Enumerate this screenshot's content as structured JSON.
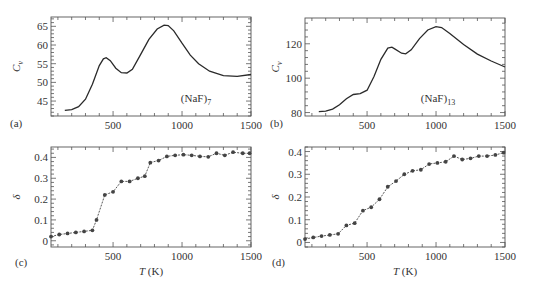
{
  "chart_data": [
    {
      "panel": "(a)",
      "type": "line",
      "ylabel": "C_v",
      "annotation": "(NaF)7",
      "xlim": [
        50,
        1500
      ],
      "ylim": [
        41,
        67.5
      ],
      "xticks": [
        500,
        1000,
        1500
      ],
      "yticks": [
        45,
        50,
        55,
        60,
        65
      ],
      "x": [
        150,
        200,
        250,
        300,
        350,
        400,
        430,
        450,
        480,
        520,
        560,
        600,
        640,
        700,
        760,
        820,
        870,
        900,
        940,
        1000,
        1060,
        1120,
        1200,
        1300,
        1400,
        1500
      ],
      "values": [
        42.5,
        42.7,
        43.5,
        45.5,
        49.5,
        54.5,
        56.3,
        56.6,
        55.8,
        53.8,
        52.6,
        52.5,
        53.5,
        57.5,
        61.5,
        64.3,
        65.3,
        65.2,
        63.8,
        60.5,
        57.3,
        55,
        53,
        51.8,
        51.6,
        52.1
      ]
    },
    {
      "panel": "(b)",
      "type": "line",
      "ylabel": "C_v",
      "annotation": "(NaF)13",
      "xlim": [
        50,
        1500
      ],
      "ylim": [
        78,
        135
      ],
      "xticks": [
        500,
        1000,
        1500
      ],
      "yticks": [
        80,
        100,
        120
      ],
      "x": [
        150,
        200,
        250,
        300,
        350,
        400,
        450,
        500,
        550,
        600,
        650,
        680,
        700,
        750,
        780,
        820,
        880,
        940,
        1000,
        1040,
        1100,
        1200,
        1300,
        1400,
        1500
      ],
      "values": [
        80.5,
        80.8,
        82,
        84.5,
        88,
        90.5,
        91,
        93,
        101,
        111,
        117.5,
        118,
        117,
        114.5,
        114.2,
        116.5,
        123,
        128,
        130,
        129.5,
        126,
        119.5,
        114,
        110,
        106.5
      ]
    },
    {
      "panel": "(c)",
      "type": "line",
      "ylabel": "δ",
      "xlabel": "T (K)",
      "xlim": [
        50,
        1500
      ],
      "ylim": [
        -0.03,
        0.45
      ],
      "xticks": [
        500,
        1000,
        1500
      ],
      "yticks": [
        0,
        0.1,
        0.2,
        0.3,
        0.4
      ],
      "x": [
        50,
        110,
        170,
        230,
        290,
        350,
        380,
        440,
        500,
        560,
        620,
        680,
        730,
        770,
        830,
        890,
        950,
        1010,
        1070,
        1130,
        1190,
        1250,
        1310,
        1370,
        1440,
        1490
      ],
      "values": [
        0.02,
        0.03,
        0.035,
        0.04,
        0.045,
        0.05,
        0.1,
        0.22,
        0.235,
        0.285,
        0.285,
        0.3,
        0.31,
        0.375,
        0.385,
        0.405,
        0.41,
        0.413,
        0.41,
        0.405,
        0.403,
        0.42,
        0.41,
        0.425,
        0.42,
        0.42
      ]
    },
    {
      "panel": "(d)",
      "type": "line",
      "ylabel": "δ",
      "xlabel": "T (K)",
      "xlim": [
        50,
        1500
      ],
      "ylim": [
        -0.02,
        0.42
      ],
      "xticks": [
        500,
        1000,
        1500
      ],
      "yticks": [
        0,
        0.1,
        0.2,
        0.3,
        0.4
      ],
      "x": [
        50,
        110,
        170,
        230,
        290,
        350,
        410,
        470,
        530,
        590,
        650,
        710,
        770,
        830,
        890,
        950,
        1010,
        1070,
        1130,
        1190,
        1250,
        1310,
        1370,
        1430,
        1490
      ],
      "values": [
        0.015,
        0.022,
        0.028,
        0.033,
        0.038,
        0.075,
        0.085,
        0.14,
        0.155,
        0.19,
        0.245,
        0.27,
        0.3,
        0.315,
        0.32,
        0.345,
        0.35,
        0.355,
        0.38,
        0.365,
        0.37,
        0.38,
        0.38,
        0.385,
        0.395
      ]
    }
  ],
  "labels": {
    "a": "(a)",
    "b": "(b)",
    "c": "(c)",
    "d": "(d)",
    "cv": "C",
    "cv_sub": "v",
    "delta": "δ",
    "xlabel_T": "T",
    "xlabel_unit": " (K)",
    "ann_a": "(NaF)",
    "ann_a_sub": "7",
    "ann_b": "(NaF)",
    "ann_b_sub": "13"
  }
}
